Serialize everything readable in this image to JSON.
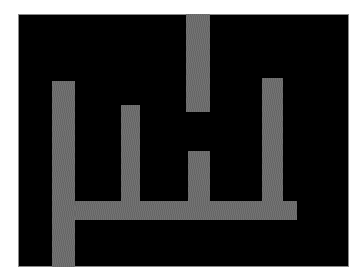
{
  "figure": {
    "background_color": "#ffffff",
    "panel_color": "#000000",
    "bar_color": "#6c6c6c",
    "panel": {
      "left": 18,
      "top": 14,
      "width": 331,
      "height": 253
    },
    "shapes": [
      {
        "name": "left-vertical-bar",
        "left": 52,
        "top": 81,
        "width": 23,
        "height": 186
      },
      {
        "name": "horizontal-bar",
        "left": 75,
        "top": 201,
        "width": 222,
        "height": 19
      },
      {
        "name": "second-vertical-bar",
        "left": 121,
        "top": 105,
        "width": 19,
        "height": 96
      },
      {
        "name": "top-hanging-bar",
        "left": 186,
        "top": 14,
        "width": 24,
        "height": 98
      },
      {
        "name": "third-vertical-bar",
        "left": 188,
        "top": 151,
        "width": 22,
        "height": 50
      },
      {
        "name": "right-vertical-bar",
        "left": 262,
        "top": 78,
        "width": 21,
        "height": 123
      }
    ]
  }
}
